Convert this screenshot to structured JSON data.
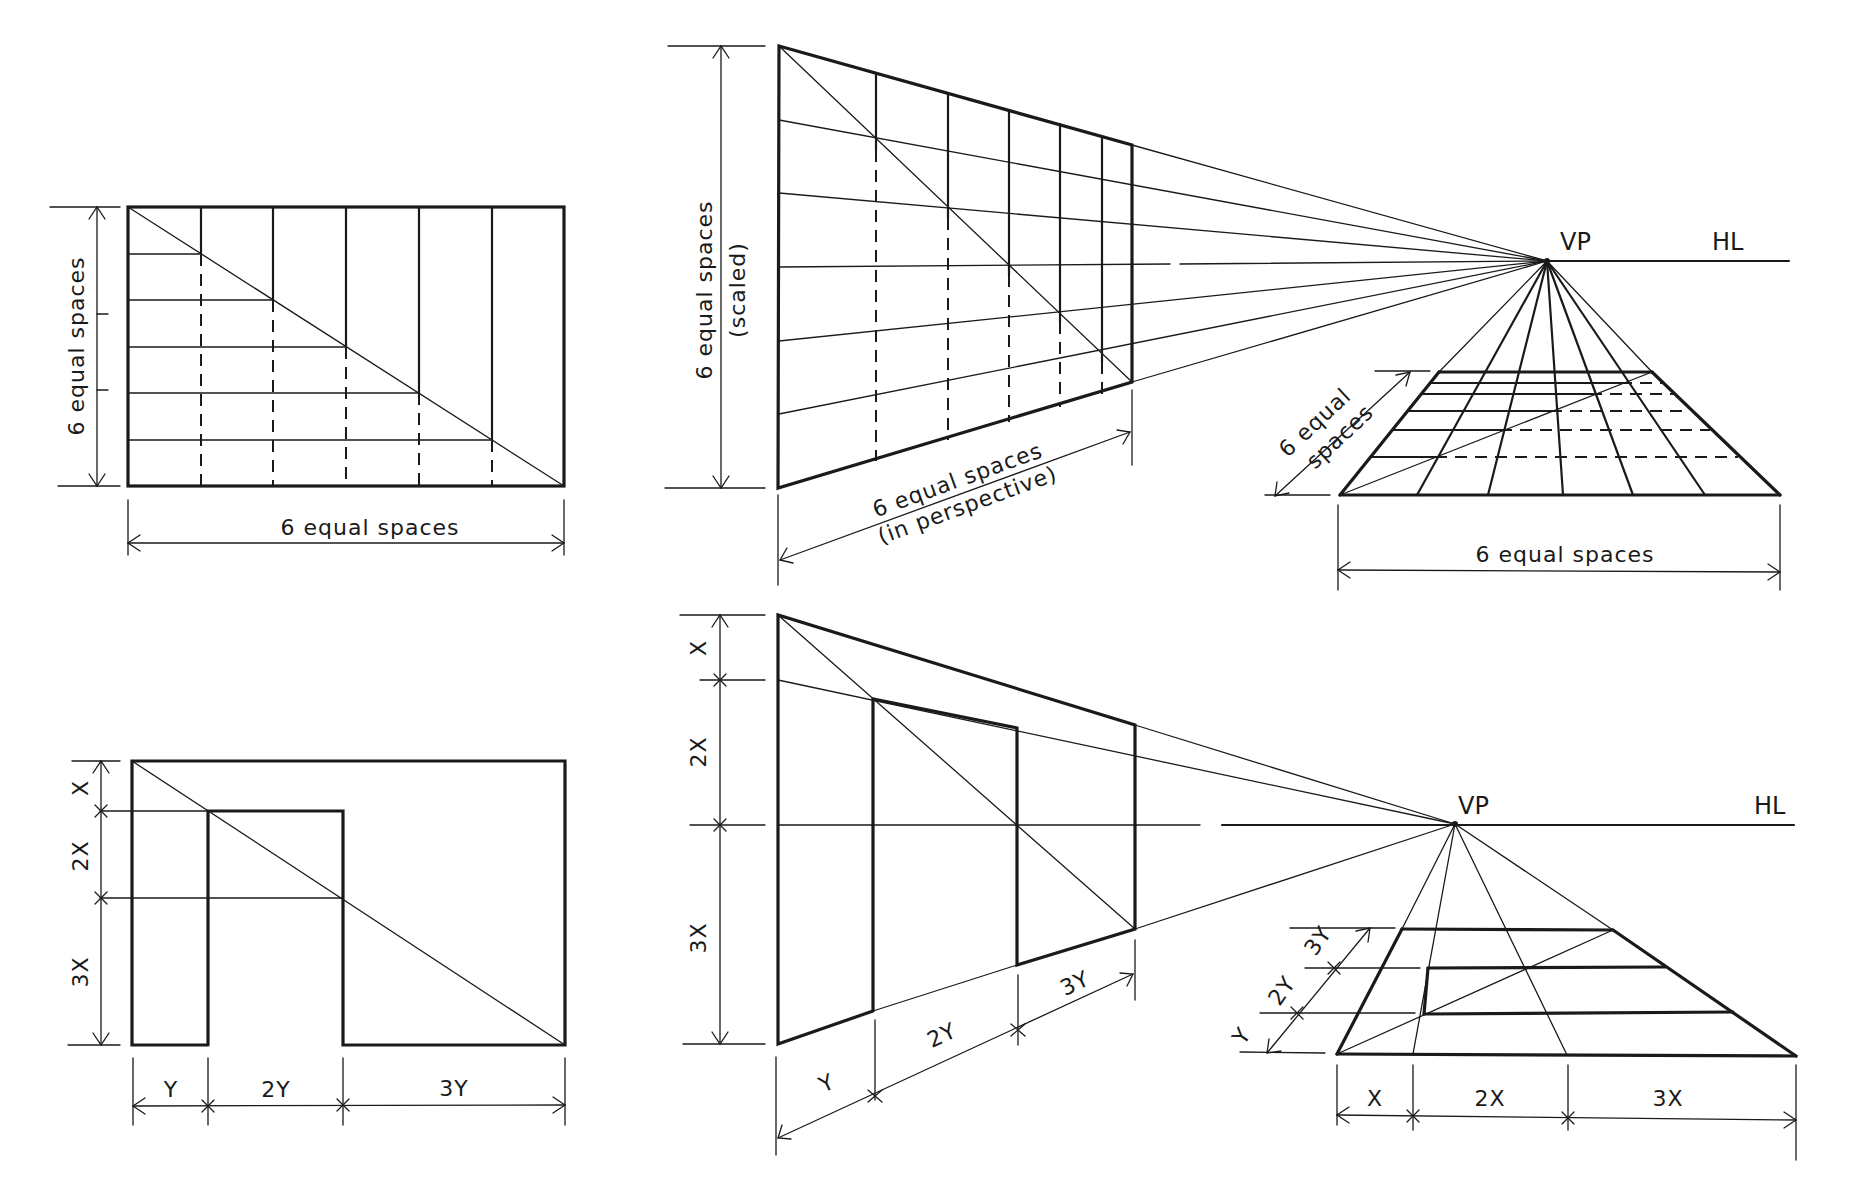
{
  "diagram": {
    "colors": {
      "ink": "#1a1a1a",
      "paper": "#ffffff"
    },
    "panels": {
      "elevation_grid": {
        "height_label": "6 equal spaces",
        "width_label": "6 equal spaces"
      },
      "perspective_wall_grid": {
        "height_label_line1": "6 equal spaces",
        "height_label_line2": "(scaled)",
        "depth_label_line1": "6 equal spaces",
        "depth_label_line2": "(in perspective)"
      },
      "perspective_floor_grid": {
        "vp_label": "VP",
        "hl_label": "HL",
        "depth_label_line1": "6 equal",
        "depth_label_line2": "spaces",
        "width_label": "6 equal spaces"
      },
      "elevation_door": {
        "height_labels": [
          "X",
          "2X",
          "3X"
        ],
        "width_labels": [
          "Y",
          "2Y",
          "3Y"
        ]
      },
      "perspective_wall_door": {
        "height_labels": [
          "X",
          "2X",
          "3X"
        ],
        "depth_labels": [
          "Y",
          "2Y",
          "3Y"
        ]
      },
      "perspective_floor_door": {
        "vp_label": "VP",
        "hl_label": "HL",
        "depth_labels": [
          "Y",
          "2Y",
          "3Y"
        ],
        "width_labels": [
          "X",
          "2X",
          "3X"
        ]
      }
    }
  }
}
